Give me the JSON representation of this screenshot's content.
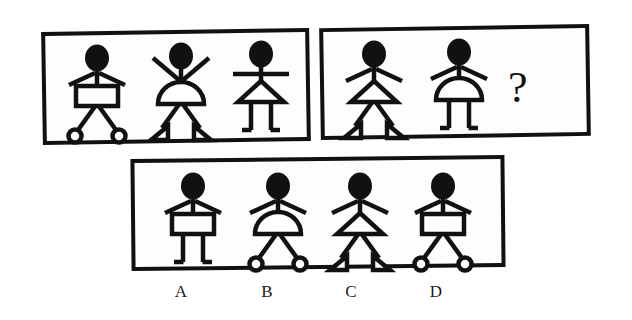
{
  "page": {
    "kind": "visual-analogy-puzzle",
    "background_color": "#ffffff",
    "ink_color": "#111111",
    "width": 632,
    "height": 320
  },
  "question_mark": {
    "text": "?",
    "x": 508,
    "y": 66,
    "font_size": 44
  },
  "panels": [
    {
      "name": "sequence-panel-top-left",
      "x": 42,
      "y": 30,
      "w": 268,
      "h": 113,
      "rotate": -0.9,
      "border": 4
    },
    {
      "name": "sequence-panel-top-right",
      "x": 320,
      "y": 26,
      "w": 270,
      "h": 112,
      "rotate": -0.9,
      "border": 4
    },
    {
      "name": "options-panel-bottom",
      "x": 131,
      "y": 157,
      "w": 374,
      "h": 112,
      "rotate": -0.6,
      "border": 4
    }
  ],
  "figures": [
    {
      "id": "fig-1-1",
      "panel": 0,
      "x": 62,
      "y": 38,
      "arms": "droop",
      "body": "rectangle",
      "legs": "spread",
      "feet": "circle"
    },
    {
      "id": "fig-1-2",
      "panel": 0,
      "x": 146,
      "y": 36,
      "arms": "up",
      "body": "dome",
      "legs": "spread",
      "feet": "triangle"
    },
    {
      "id": "fig-1-3",
      "panel": 0,
      "x": 226,
      "y": 34,
      "arms": "straight",
      "body": "triangle",
      "legs": "parallel",
      "feet": "flick"
    },
    {
      "id": "fig-2-1",
      "panel": 1,
      "x": 339,
      "y": 34,
      "arms": "droop",
      "body": "triangle",
      "legs": "spread",
      "feet": "triangle"
    },
    {
      "id": "fig-2-2",
      "panel": 1,
      "x": 424,
      "y": 32,
      "arms": "droop",
      "body": "dome",
      "legs": "parallel",
      "feet": "flick"
    },
    {
      "id": "option-A",
      "panel": 2,
      "x": 158,
      "y": 166,
      "arms": "droop",
      "body": "rectangle",
      "legs": "parallel",
      "feet": "flick"
    },
    {
      "id": "option-B",
      "panel": 2,
      "x": 243,
      "y": 166,
      "arms": "droop",
      "body": "dome",
      "legs": "spread",
      "feet": "circle"
    },
    {
      "id": "option-C",
      "panel": 2,
      "x": 325,
      "y": 166,
      "arms": "droop",
      "body": "triangle",
      "legs": "spread",
      "feet": "triangle"
    },
    {
      "id": "option-D",
      "panel": 2,
      "x": 408,
      "y": 166,
      "arms": "droop",
      "body": "rectangle",
      "legs": "spread",
      "feet": "circle"
    }
  ],
  "option_labels": [
    {
      "text": "A",
      "x": 181,
      "y": 283
    },
    {
      "text": "B",
      "x": 267,
      "y": 283
    },
    {
      "text": "C",
      "x": 351,
      "y": 283
    },
    {
      "text": "D",
      "x": 436,
      "y": 283
    }
  ]
}
